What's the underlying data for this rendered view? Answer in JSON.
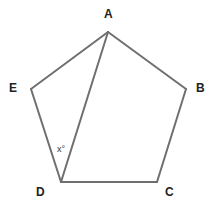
{
  "diagram": {
    "type": "regular-pentagon",
    "vertices": [
      "A",
      "B",
      "C",
      "D",
      "E"
    ],
    "edges": [
      [
        "A",
        "B"
      ],
      [
        "B",
        "C"
      ],
      [
        "C",
        "D"
      ],
      [
        "D",
        "E"
      ],
      [
        "E",
        "A"
      ]
    ],
    "diagonals": [
      [
        "A",
        "D"
      ]
    ],
    "angle_label": {
      "text": "x°",
      "vertex": "D",
      "between": [
        "E",
        "A"
      ]
    },
    "labels": {
      "A": "A",
      "B": "B",
      "C": "C",
      "D": "D",
      "E": "E"
    },
    "line_color": "#6f6f6f"
  }
}
